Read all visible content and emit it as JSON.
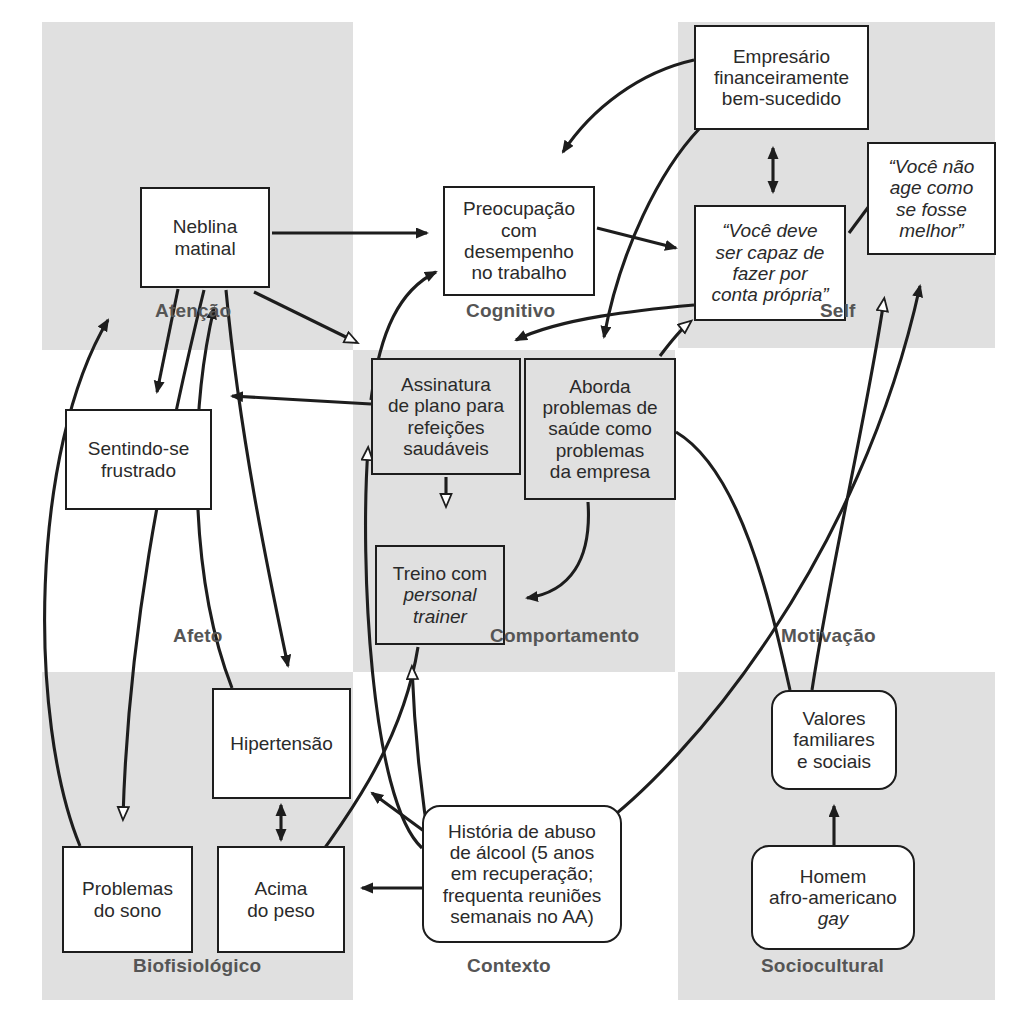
{
  "diagram": {
    "language": "pt-BR",
    "colors": {
      "panel": "#e0e0e0",
      "stroke": "#1d1d1d",
      "text": "#2a2a2a",
      "label": "#555555",
      "background": "#ffffff"
    }
  },
  "domains": [
    {
      "key": "atencao",
      "label": "Atenção",
      "x": 155,
      "y": 300
    },
    {
      "key": "cognitivo",
      "label": "Cognitivo",
      "x": 466,
      "y": 300
    },
    {
      "key": "self",
      "label": "Self",
      "x": 820,
      "y": 300
    },
    {
      "key": "afeto",
      "label": "Afeto",
      "x": 173,
      "y": 625
    },
    {
      "key": "comportamento",
      "label": "Comportamento",
      "x": 490,
      "y": 625
    },
    {
      "key": "motivacao",
      "label": "Motivação",
      "x": 781,
      "y": 625
    },
    {
      "key": "biofisiologico",
      "label": "Biofisiológico",
      "x": 133,
      "y": 955
    },
    {
      "key": "contexto",
      "label": "Contexto",
      "x": 467,
      "y": 955
    },
    {
      "key": "sociocultural",
      "label": "Sociocultural",
      "x": 761,
      "y": 955
    }
  ],
  "panels": [
    {
      "key": "panel-attention-cognitive",
      "x": 42,
      "y": 22,
      "w": 311,
      "h": 328
    },
    {
      "key": "panel-self",
      "x": 678,
      "y": 22,
      "w": 317,
      "h": 326
    },
    {
      "key": "panel-behavior",
      "x": 353,
      "y": 350,
      "w": 322,
      "h": 322
    },
    {
      "key": "panel-biophysiological",
      "x": 42,
      "y": 672,
      "w": 311,
      "h": 328
    },
    {
      "key": "panel-sociocultural",
      "x": 678,
      "y": 672,
      "w": 317,
      "h": 328
    }
  ],
  "nodes": [
    {
      "key": "neblina-matinal",
      "text": "Neblina\nmatinal",
      "x": 140,
      "y": 187,
      "w": 130,
      "h": 101,
      "shape": "rect",
      "fill": "white",
      "italic": false,
      "font": 19
    },
    {
      "key": "sentindo-se-frustrado",
      "text": "Sentindo-se\nfrustrado",
      "x": 65,
      "y": 409,
      "w": 147,
      "h": 101,
      "shape": "rect",
      "fill": "white",
      "italic": false,
      "font": 19
    },
    {
      "key": "preocupacao-trabalho",
      "text": "Preocupação\ncom\ndesempenho\nno trabalho",
      "x": 443,
      "y": 186,
      "w": 152,
      "h": 110,
      "shape": "rect",
      "fill": "white",
      "italic": false,
      "font": 19
    },
    {
      "key": "empresario-sucedido",
      "text": "Empresário\nfinanceiramente\nbem-sucedido",
      "x": 694,
      "y": 25,
      "w": 175,
      "h": 105,
      "shape": "rect",
      "fill": "white",
      "italic": false,
      "font": 19
    },
    {
      "key": "voce-deve-capaz",
      "text": "“Você deve\nser capaz de\nfazer por\nconta própria”",
      "x": 694,
      "y": 205,
      "w": 152,
      "h": 116,
      "shape": "rect",
      "fill": "white",
      "italic": true,
      "font": 19
    },
    {
      "key": "voce-nao-age",
      "text": "“Você não\nage como\nse fosse\nmelhor”",
      "x": 867,
      "y": 142,
      "w": 129,
      "h": 113,
      "shape": "rect",
      "fill": "white",
      "italic": true,
      "font": 19
    },
    {
      "key": "assinatura-plano",
      "text": "Assinatura\nde plano para\nrefeições\nsaudáveis",
      "x": 371,
      "y": 358,
      "w": 150,
      "h": 117,
      "shape": "rect",
      "fill": "gray",
      "italic": false,
      "font": 19
    },
    {
      "key": "aborda-problemas",
      "text": "Aborda\nproblemas de\nsaúde como\nproblemas\nda empresa",
      "x": 524,
      "y": 358,
      "w": 152,
      "h": 142,
      "shape": "rect",
      "fill": "gray",
      "italic": false,
      "font": 19
    },
    {
      "key": "treino-personal",
      "text": "Treino com\npersonal\ntrainer",
      "x": 375,
      "y": 545,
      "w": 130,
      "h": 100,
      "shape": "rect",
      "fill": "gray",
      "italic": false,
      "font": 19,
      "italic_lines": [
        1,
        2
      ]
    },
    {
      "key": "hipertensao",
      "text": "Hipertensão",
      "x": 212,
      "y": 688,
      "w": 139,
      "h": 111,
      "shape": "rect",
      "fill": "white",
      "italic": false,
      "font": 19
    },
    {
      "key": "problemas-do-sono",
      "text": "Problemas\ndo sono",
      "x": 62,
      "y": 846,
      "w": 131,
      "h": 107,
      "shape": "rect",
      "fill": "white",
      "italic": false,
      "font": 19
    },
    {
      "key": "acima-do-peso",
      "text": "Acima\ndo peso",
      "x": 217,
      "y": 846,
      "w": 128,
      "h": 107,
      "shape": "rect",
      "fill": "white",
      "italic": false,
      "font": 19
    },
    {
      "key": "historia-abuso-alcool",
      "text": "História de abuso\nde álcool (5 anos\nem recuperação;\nfrequenta reuniões\nsemanais no AA)",
      "x": 422,
      "y": 805,
      "w": 200,
      "h": 138,
      "shape": "round",
      "fill": "white",
      "italic": false,
      "font": 19
    },
    {
      "key": "valores-familiares",
      "text": "Valores\nfamiliares\ne sociais",
      "x": 771,
      "y": 690,
      "w": 126,
      "h": 100,
      "shape": "round",
      "fill": "white",
      "italic": false,
      "font": 19
    },
    {
      "key": "homem-afro-gay",
      "text": "Homem\nafro-americano\ngay",
      "x": 751,
      "y": 845,
      "w": 164,
      "h": 105,
      "shape": "round",
      "fill": "white",
      "italic": false,
      "font": 19,
      "italic_lines": [
        2
      ]
    }
  ],
  "edges": [
    {
      "key": "neblina-to-preocupacao",
      "from": "neblina-matinal",
      "to": "preocupacao-trabalho",
      "head": "filled"
    },
    {
      "key": "empresario-to-preocupacao",
      "from": "empresario-sucedido",
      "to": "preocupacao-trabalho",
      "head": "filled"
    },
    {
      "key": "preocupacao-to-vocedeve",
      "from": "preocupacao-trabalho",
      "to": "voce-deve-capaz",
      "head": "filled"
    },
    {
      "key": "empresario-vocedeve-bidir",
      "from": "empresario-sucedido",
      "to": "voce-deve-capaz",
      "head": "double-filled"
    },
    {
      "key": "vocedeve-to-vocenao",
      "from": "voce-deve-capaz",
      "to": "voce-nao-age",
      "head": "filled"
    },
    {
      "key": "empresario-to-aborda",
      "from": "empresario-sucedido",
      "to": "aborda-problemas",
      "head": "filled"
    },
    {
      "key": "vocedeve-to-assinatura",
      "from": "voce-deve-capaz",
      "to": "assinatura-plano",
      "head": "filled"
    },
    {
      "key": "aborda-to-vocedeve",
      "from": "aborda-problemas",
      "to": "voce-deve-capaz",
      "head": "open"
    },
    {
      "key": "assinatura-to-preocupacao",
      "from": "assinatura-plano",
      "to": "preocupacao-trabalho",
      "head": "filled"
    },
    {
      "key": "neblina-to-sentindo",
      "from": "neblina-matinal",
      "to": "sentindo-se-frustrado",
      "head": "filled"
    },
    {
      "key": "assinatura-to-sentindo",
      "from": "assinatura-plano",
      "to": "sentindo-se-frustrado",
      "head": "filled"
    },
    {
      "key": "problemas-sono-to-neblina",
      "from": "problemas-do-sono",
      "to": "neblina-matinal",
      "head": "filled"
    },
    {
      "key": "hipertensao-to-neblina",
      "from": "hipertensao",
      "to": "neblina-matinal",
      "head": "filled"
    },
    {
      "key": "neblina-to-assinatura",
      "from": "neblina-matinal",
      "to": "assinatura-plano",
      "head": "open"
    },
    {
      "key": "neblina-to-hipertensao",
      "from": "neblina-matinal",
      "to": "hipertensao",
      "head": "filled"
    },
    {
      "key": "neblina-to-problemas-sono",
      "from": "neblina-matinal",
      "to": "problemas-do-sono",
      "head": "open"
    },
    {
      "key": "assinatura-to-treino",
      "from": "assinatura-plano",
      "to": "treino-personal",
      "head": "open"
    },
    {
      "key": "aborda-to-treino",
      "from": "aborda-problemas",
      "to": "treino-personal",
      "head": "filled"
    },
    {
      "key": "treino-to-acima-peso",
      "from": "treino-personal",
      "to": "acima-do-peso",
      "head": "open"
    },
    {
      "key": "hipertensao-acima-bidir",
      "from": "hipertensao",
      "to": "acima-do-peso",
      "head": "double-filled"
    },
    {
      "key": "historia-to-acima-peso",
      "from": "historia-abuso-alcool",
      "to": "acima-do-peso",
      "head": "filled"
    },
    {
      "key": "historia-to-hipertensao",
      "from": "historia-abuso-alcool",
      "to": "hipertensao",
      "head": "filled"
    },
    {
      "key": "historia-to-treino",
      "from": "historia-abuso-alcool",
      "to": "treino-personal",
      "head": "open"
    },
    {
      "key": "historia-to-assinatura",
      "from": "historia-abuso-alcool",
      "to": "assinatura-plano",
      "head": "open"
    },
    {
      "key": "historia-to-vocenao",
      "from": "historia-abuso-alcool",
      "to": "voce-nao-age",
      "head": "filled"
    },
    {
      "key": "aborda-to-valores",
      "from": "aborda-problemas",
      "to": "valores-familiares",
      "head": "none"
    },
    {
      "key": "valores-to-vocenao",
      "from": "valores-familiares",
      "to": "voce-nao-age",
      "head": "open"
    },
    {
      "key": "homem-to-valores",
      "from": "homem-afro-gay",
      "to": "valores-familiares",
      "head": "filled"
    }
  ]
}
